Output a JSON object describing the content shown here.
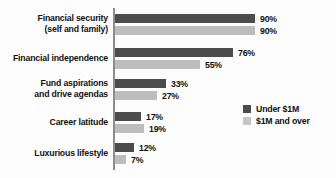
{
  "chart_data": {
    "type": "bar",
    "orientation": "horizontal",
    "title": "",
    "subtitle": "",
    "xlabel": "",
    "ylabel": "",
    "xlim": [
      0,
      100
    ],
    "grid": false,
    "legend_position": "right-middle",
    "value_suffix": "%",
    "categories": [
      "Financial security\n(self and family)",
      "Financial independence",
      "Fund aspirations\nand drive agendas",
      "Career latitude",
      "Luxurious lifestyle"
    ],
    "series": [
      {
        "name": "Under $1M",
        "color": "#4c4c4c",
        "values": [
          90,
          76,
          33,
          17,
          12
        ],
        "labels": [
          "90%",
          "76%",
          "33%",
          "17%",
          "12%"
        ]
      },
      {
        "name": "$1M and over",
        "color": "#bdbdbd",
        "values": [
          90,
          55,
          27,
          19,
          7
        ],
        "labels": [
          "90%",
          "55%",
          "27%",
          "19%",
          "7%"
        ]
      }
    ]
  },
  "legend": {
    "items": [
      {
        "label": "Under $1M",
        "color": "#4c4c4c"
      },
      {
        "label": "$1M and over",
        "color": "#c6c6c6"
      }
    ]
  },
  "axis": {
    "color": "#8d8d8d"
  },
  "layout": {
    "group_tops": [
      14,
      48,
      79,
      112,
      143
    ],
    "px_per_unit": 1.55
  }
}
